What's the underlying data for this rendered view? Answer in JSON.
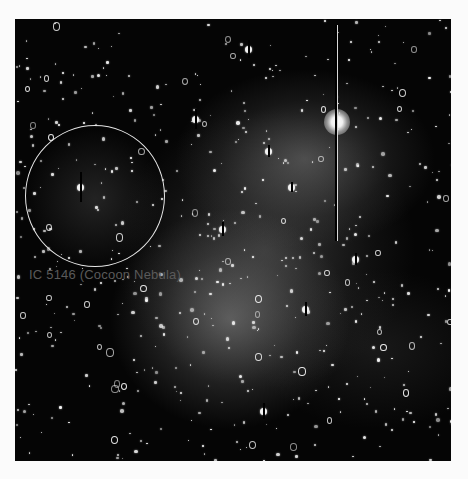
{
  "image": {
    "subject": "astronomical star field photograph",
    "frame": {
      "x": 15,
      "y": 19,
      "width": 436,
      "height": 442,
      "background": "#050505"
    }
  },
  "annotation": {
    "circle": {
      "center_x": 80,
      "center_y": 177,
      "radius": 70,
      "color": "#e6e6e6"
    },
    "label": "IC 5146 (Cocoon Nebula)",
    "label_color": "#5a5a5a"
  },
  "bright_star": {
    "x": 322,
    "y": 103,
    "bleed_line_top": 6,
    "bleed_line_bottom": 222
  },
  "caption": {
    "text": "",
    "note_visible": "caption line clipped at bottom edge"
  },
  "stars": {
    "seed": 5146,
    "count": 520,
    "ring_fraction": 0.12,
    "bleed_stars": [
      {
        "x": 180,
        "y": 100,
        "h": 20
      },
      {
        "x": 65,
        "y": 168,
        "h": 30
      },
      {
        "x": 207,
        "y": 210,
        "h": 14
      },
      {
        "x": 253,
        "y": 132,
        "h": 12
      },
      {
        "x": 276,
        "y": 168,
        "h": 10
      },
      {
        "x": 233,
        "y": 30,
        "h": 18
      },
      {
        "x": 248,
        "y": 392,
        "h": 16
      },
      {
        "x": 290,
        "y": 290,
        "h": 14
      },
      {
        "x": 340,
        "y": 240,
        "h": 12
      }
    ]
  }
}
